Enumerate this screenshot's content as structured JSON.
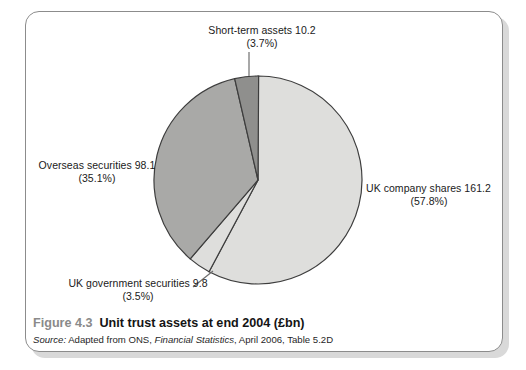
{
  "figure": {
    "caption_number": "Figure 4.3",
    "caption_title": "Unit trust assets at end 2004 (£bn)",
    "source_lead": "Source:",
    "source_text_1": " Adapted from ONS, ",
    "source_publication": "Financial Statistics",
    "source_text_2": ", April 2006, Table 5.2D"
  },
  "labels": {
    "uk_company": {
      "value_line": "UK company shares 161.2",
      "pct_line": "(57.8%)"
    },
    "overseas": {
      "value_line": "Overseas securities 98.1",
      "pct_line": "(35.1%)"
    },
    "short_term": {
      "value_line": "Short-term assets 10.2",
      "pct_line": "(3.7%)"
    },
    "uk_gov": {
      "value_line": "UK government securities 9.8",
      "pct_line": "(3.5%)"
    }
  },
  "chart_data": {
    "type": "pie",
    "title": "Unit trust assets at end 2004 (£bn)",
    "unit": "£bn",
    "categories": [
      "UK company shares",
      "UK government securities",
      "Overseas securities",
      "Short-term assets"
    ],
    "values": [
      161.2,
      9.8,
      98.1,
      10.2
    ],
    "percentages": [
      57.8,
      3.5,
      35.1,
      3.7
    ],
    "colors": [
      "#dededc",
      "#dededc",
      "#a9a9a7",
      "#8f8f8d"
    ],
    "total": 279.3,
    "start_angle_deg": 0,
    "direction": "clockwise",
    "legend": "none",
    "labels_position": "outside-with-leader-lines",
    "grid": false,
    "xlabel": "",
    "ylabel": ""
  },
  "style": {
    "frame_border": "#8c8c8c",
    "frame_shadow": "#d9d9d9",
    "slice_outline": "#3d3d3d",
    "leader_line": "#6e6e6e",
    "caption_number_color": "#8a8a8a",
    "text_color": "#1a1a1a"
  }
}
